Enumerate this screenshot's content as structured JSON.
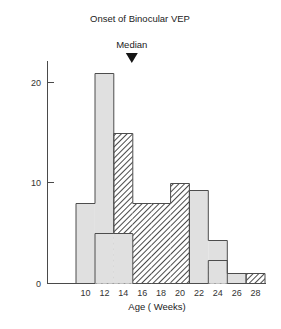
{
  "chart_data": {
    "type": "bar",
    "title": "Onset of Binocular VEP",
    "xlabel": "Age ( Weeks)",
    "ylabel": "",
    "xlim": [
      8,
      29
    ],
    "ylim": [
      0,
      23
    ],
    "grid": false,
    "legend_position": "none",
    "bin_width": 2,
    "bin_edges": [
      9,
      11,
      13,
      15,
      17,
      19,
      21,
      23,
      25,
      27,
      29
    ],
    "categories": [
      "9-11",
      "11-13",
      "13-15",
      "15-17",
      "17-19",
      "19-21",
      "21-23",
      "23-25",
      "25-27",
      "27-29"
    ],
    "series": [
      {
        "name": "light-gray-series",
        "fill": "solid-light-gray",
        "values": [
          8,
          21,
          5,
          0,
          0,
          0,
          9.3,
          4.3,
          1,
          0
        ]
      },
      {
        "name": "hatched-series",
        "fill": "diagonal-hatch",
        "values": [
          0,
          5,
          15,
          8,
          8,
          10,
          0,
          2.3,
          0,
          1
        ]
      }
    ],
    "yticks": [
      0,
      10,
      20
    ],
    "ytick_labels": [
      "0",
      "10",
      "20"
    ],
    "xticks": [
      10,
      12,
      14,
      16,
      18,
      20,
      22,
      24,
      26,
      28
    ],
    "xtick_labels": [
      "10",
      "12",
      "14",
      "16",
      "18",
      "20",
      "22",
      "24",
      "26",
      "28"
    ],
    "annotations": [
      {
        "name": "median-marker",
        "label": "Median",
        "x": 14.9,
        "marker": "down-triangle"
      }
    ],
    "colors": {
      "light_gray_fill": "#e0e0e0",
      "hatch_stroke": "#4a4a4a",
      "outline": "#4d4d4d",
      "axis": "#4a4a4a",
      "text": "#222222"
    }
  }
}
